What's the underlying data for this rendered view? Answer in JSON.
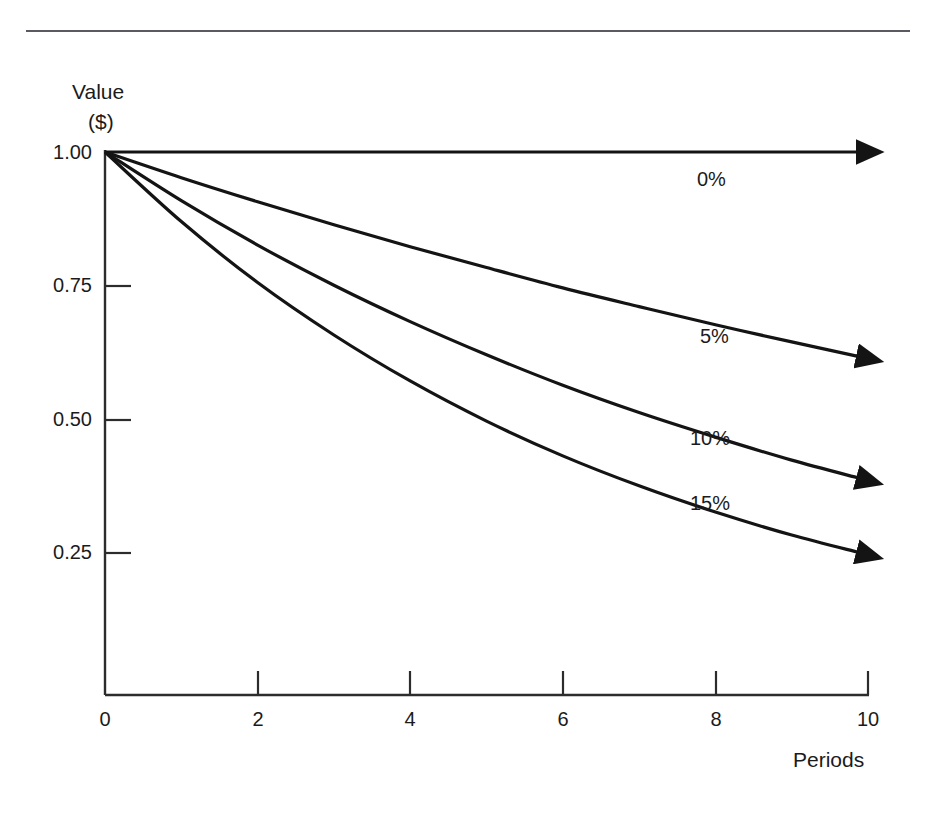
{
  "chart_data": {
    "type": "line",
    "title": "",
    "subtitle": "",
    "xlabel": "Periods",
    "ylabel": "Value ($)",
    "ylabel_lines": [
      "Value",
      "($)"
    ],
    "xlim": [
      0,
      10
    ],
    "ylim": [
      0,
      1.0
    ],
    "xticks": [
      "0",
      "2",
      "4",
      "6",
      "8",
      "10"
    ],
    "xtick_values": [
      0,
      2,
      4,
      6,
      8,
      10
    ],
    "yticks": [
      "1.00",
      "0.75",
      "0.50",
      "0.25"
    ],
    "ytick_values": [
      1.0,
      0.75,
      0.5,
      0.25
    ],
    "grid": false,
    "legend_position": "inline-annotations",
    "x": [
      0,
      1,
      2,
      3,
      4,
      5,
      6,
      7,
      8,
      9,
      10
    ],
    "series": [
      {
        "name": "0%",
        "rate": 0.0,
        "label": "0%",
        "values": [
          1.0,
          1.0,
          1.0,
          1.0,
          1.0,
          1.0,
          1.0,
          1.0,
          1.0,
          1.0,
          1.0
        ]
      },
      {
        "name": "5%",
        "rate": 0.05,
        "label": "5%",
        "values": [
          1.0,
          0.952,
          0.907,
          0.864,
          0.823,
          0.784,
          0.746,
          0.711,
          0.677,
          0.645,
          0.614
        ]
      },
      {
        "name": "10%",
        "rate": 0.1,
        "label": "10%",
        "values": [
          1.0,
          0.909,
          0.826,
          0.751,
          0.683,
          0.621,
          0.564,
          0.513,
          0.467,
          0.424,
          0.386
        ]
      },
      {
        "name": "15%",
        "rate": 0.15,
        "label": "15%",
        "values": [
          1.0,
          0.87,
          0.756,
          0.658,
          0.572,
          0.497,
          0.432,
          0.376,
          0.327,
          0.284,
          0.247
        ]
      }
    ],
    "annotations": [
      {
        "text": "0%",
        "x": 8.0,
        "y": 0.93
      },
      {
        "text": "5%",
        "x": 8.0,
        "y": 0.655
      },
      {
        "text": "10%",
        "x": 7.9,
        "y": 0.47
      },
      {
        "text": "15%",
        "x": 7.9,
        "y": 0.355
      }
    ],
    "line_color": "#1a1a1a",
    "axis_color": "#3a3a3a",
    "background_color": "#ffffff",
    "arrowheads": true
  },
  "page": {
    "divider": "horizontal-rule"
  }
}
